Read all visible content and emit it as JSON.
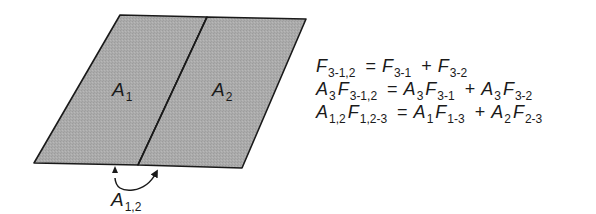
{
  "figure": {
    "type": "view-factor-diagram",
    "fill_color": "#a9a9a9",
    "stroke_color": "#1a1a1a",
    "background": "#ffffff",
    "surfaces": [
      {
        "symbol": "A",
        "subscript": "1"
      },
      {
        "symbol": "A",
        "subscript": "2"
      }
    ],
    "combined_surface": {
      "symbol": "A",
      "subscript": "1,2"
    }
  },
  "equations": [
    {
      "lhs": [
        {
          "sym": "F",
          "sub": "3-1,2"
        }
      ],
      "rhs_terms": [
        [
          {
            "sym": "F",
            "sub": "3-1"
          }
        ],
        [
          {
            "sym": "F",
            "sub": "3-2"
          }
        ]
      ]
    },
    {
      "lhs": [
        {
          "sym": "A",
          "sub": "3"
        },
        {
          "sym": "F",
          "sub": "3-1,2"
        }
      ],
      "rhs_terms": [
        [
          {
            "sym": "A",
            "sub": "3"
          },
          {
            "sym": "F",
            "sub": "3-1"
          }
        ],
        [
          {
            "sym": "A",
            "sub": "3"
          },
          {
            "sym": "F",
            "sub": "3-2"
          }
        ]
      ]
    },
    {
      "lhs": [
        {
          "sym": "A",
          "sub": "1,2"
        },
        {
          "sym": "F",
          "sub": "1,2-3"
        }
      ],
      "rhs_terms": [
        [
          {
            "sym": "A",
            "sub": "1"
          },
          {
            "sym": "F",
            "sub": "1-3"
          }
        ],
        [
          {
            "sym": "A",
            "sub": "2"
          },
          {
            "sym": "F",
            "sub": "2-3"
          }
        ]
      ]
    }
  ],
  "operators": {
    "equals": "=",
    "plus": "+"
  }
}
